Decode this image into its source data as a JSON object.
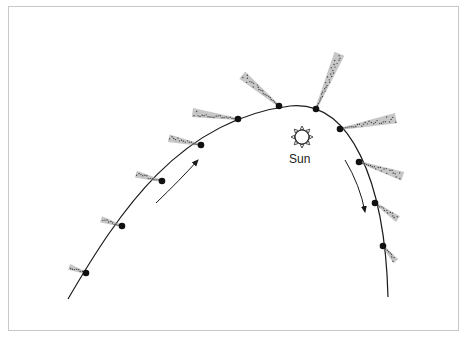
{
  "diagram": {
    "labels": {
      "sun": "Sun"
    },
    "colors": {
      "orbit": "#1a1a1a",
      "tail": "#666666",
      "frame": "#c8c8c8"
    },
    "orbit_path": "M 68 299 C 120 210, 180 120, 290 106 C 350 100, 385 180, 388 297",
    "comet_positions": [
      {
        "x": 86,
        "y": 273,
        "tail_angle": 200,
        "tail_length": 18
      },
      {
        "x": 122,
        "y": 226,
        "tail_angle": 198,
        "tail_length": 22
      },
      {
        "x": 162,
        "y": 181,
        "tail_angle": 195,
        "tail_length": 27
      },
      {
        "x": 201,
        "y": 145,
        "tail_angle": 192,
        "tail_length": 33
      },
      {
        "x": 238,
        "y": 119,
        "tail_angle": 188,
        "tail_length": 46
      },
      {
        "x": 279,
        "y": 106,
        "tail_angle": 220,
        "tail_length": 48
      },
      {
        "x": 316,
        "y": 109,
        "tail_angle": 293,
        "tail_length": 60
      },
      {
        "x": 340,
        "y": 129,
        "tail_angle": 349,
        "tail_length": 57
      },
      {
        "x": 359,
        "y": 162,
        "tail_angle": 18,
        "tail_length": 46
      },
      {
        "x": 375,
        "y": 203,
        "tail_angle": 35,
        "tail_length": 28
      },
      {
        "x": 383,
        "y": 246,
        "tail_angle": 50,
        "tail_length": 20
      }
    ],
    "sun": {
      "x": 302,
      "y": 137,
      "r": 7
    },
    "arrows": [
      {
        "name": "arrow-ascending",
        "path": "M 156 203 Q 180 180 198 160"
      },
      {
        "name": "arrow-descending",
        "path": "M 345 160 Q 360 185 365 212"
      }
    ]
  }
}
